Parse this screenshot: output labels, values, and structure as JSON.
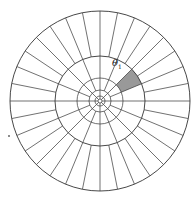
{
  "diagram": {
    "type": "polar-grid",
    "center": [
      100,
      101
    ],
    "rings": [
      {
        "r": 90,
        "spokes_from": 45,
        "spoke_count": 32
      },
      {
        "r": 45,
        "spokes_from": 23,
        "spoke_count": 16
      },
      {
        "r": 23,
        "spokes_from": 11,
        "spoke_count": 16
      },
      {
        "r": 11,
        "spokes_from": 5,
        "spoke_count": 8
      },
      {
        "r": 5,
        "spokes_from": 2,
        "spoke_count": 8
      },
      {
        "r": 2,
        "spokes_from": 0,
        "spoke_count": 0
      }
    ],
    "line_color": "#333333",
    "shaded_sector": {
      "r_inner": 23,
      "r_outer": 45,
      "start_deg": 45,
      "end_deg": 67.5,
      "fill": "#999999"
    },
    "label": {
      "text": "θ",
      "subscript": "1",
      "x": 113,
      "y": 59
    },
    "marker_dot": {
      "x": 8,
      "y": 135
    }
  }
}
